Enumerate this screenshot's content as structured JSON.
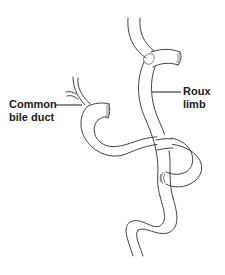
{
  "diagram": {
    "type": "anatomical illustration",
    "labels": {
      "common_bile_duct_line1": "Common",
      "common_bile_duct_line2": "bile duct",
      "roux_limb_line1": "Roux",
      "roux_limb_line2": "limb"
    },
    "structures": [
      {
        "name": "common-bile-duct",
        "description": "thin branching duct entering bowel stub"
      },
      {
        "name": "roux-limb",
        "description": "long jejunal limb descending from top anastomosis"
      },
      {
        "name": "biliopancreatic-limb",
        "description": "loop crossing over Roux limb to enteroenteric anastomosis"
      },
      {
        "name": "stapled-ends",
        "description": "closed blind ends marked with staple lines"
      }
    ],
    "colors": {
      "line": "#2b2b2b",
      "background": "#ffffff",
      "text": "#1a1a1a"
    }
  }
}
